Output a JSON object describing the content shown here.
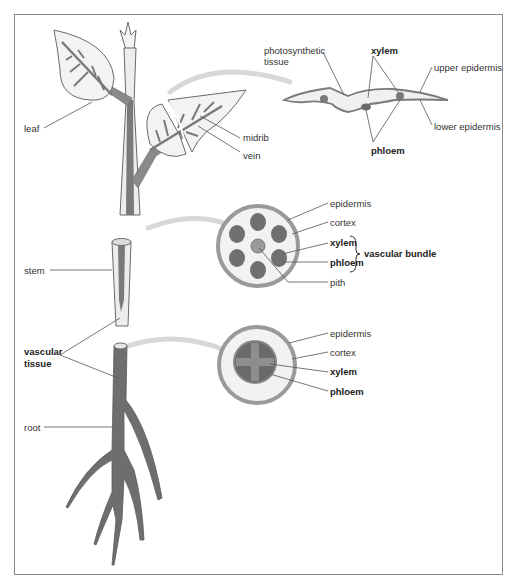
{
  "figure": {
    "colors": {
      "frame": "#8a8a8a",
      "vascular": "#6e6e6e",
      "vascular_dark": "#5c5c5c",
      "tissue_light": "#ececec",
      "epidermis": "#9a9a9a",
      "arrow": "#d8d8d8",
      "leader_line": "#555555"
    }
  },
  "plant": {
    "labels": {
      "leaf": "leaf",
      "midrib": "midrib",
      "vein": "vein",
      "stem": "stem",
      "vascular_tissue_line1": "vascular",
      "vascular_tissue_line2": "tissue",
      "root": "root"
    }
  },
  "leaf_section": {
    "labels": {
      "photosynthetic_line1": "photosynthetic",
      "photosynthetic_line2": "tissue",
      "xylem": "xylem",
      "upper_epidermis": "upper epidermis",
      "lower_epidermis": "lower epidermis",
      "phloem": "phloem"
    }
  },
  "stem_section": {
    "labels": {
      "epidermis": "epidermis",
      "cortex": "cortex",
      "xylem": "xylem",
      "phloem": "phloem",
      "vascular_bundle": "vascular bundle",
      "pith": "pith"
    }
  },
  "root_section": {
    "labels": {
      "epidermis": "epidermis",
      "cortex": "cortex",
      "xylem": "xylem",
      "phloem": "phloem"
    }
  }
}
